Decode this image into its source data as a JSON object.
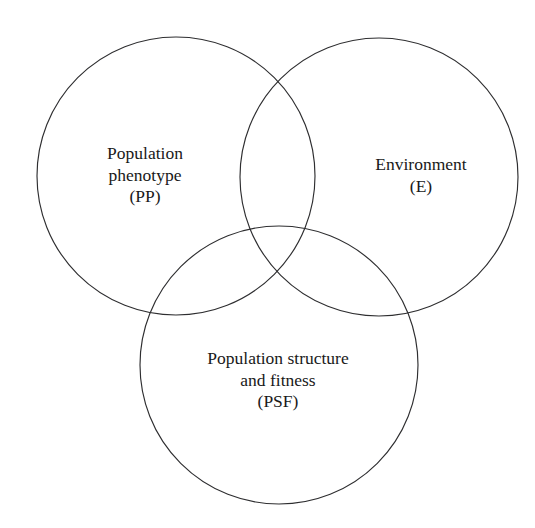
{
  "diagram": {
    "type": "venn",
    "set_count": 3,
    "background_color": "#ffffff",
    "stroke_color": "#2e2e30",
    "text_color": "#191919",
    "sets": [
      {
        "id": "pp",
        "name": "Population phenotype",
        "abbreviation": "(PP)",
        "position": "top-left",
        "label_lines": [
          "Population",
          "phenotype",
          "(PP)"
        ],
        "line1": "Population",
        "line2": "phenotype",
        "line3": "(PP)",
        "circle": {
          "cx": 176,
          "cy": 176,
          "r": 139
        }
      },
      {
        "id": "e",
        "name": "Environment",
        "abbreviation": "(E)",
        "position": "top-right",
        "label_lines": [
          "Environment",
          "(E)"
        ],
        "line1": "Environment",
        "line2": "(E)",
        "circle": {
          "cx": 379,
          "cy": 177,
          "r": 139
        }
      },
      {
        "id": "psf",
        "name": "Population structure and fitness",
        "abbreviation": "(PSF)",
        "position": "bottom-center",
        "label_lines": [
          "Population structure",
          "and fitness",
          "(PSF)"
        ],
        "line1": "Population structure",
        "line2": "and fitness",
        "line3": "(PSF)",
        "circle": {
          "cx": 279,
          "cy": 365,
          "r": 139
        }
      }
    ]
  }
}
